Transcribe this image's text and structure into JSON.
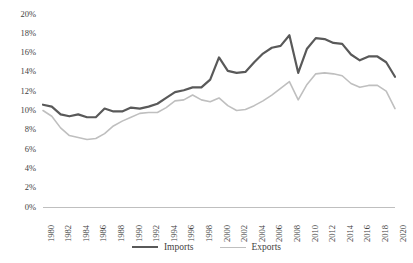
{
  "chart_data": {
    "type": "line",
    "title": "",
    "xlabel": "",
    "ylabel": "",
    "xlim": [
      1980,
      2020
    ],
    "ylim": [
      0,
      20
    ],
    "y_tick_suffix": "%",
    "y_ticks": [
      0,
      2,
      4,
      6,
      8,
      10,
      12,
      14,
      16,
      18,
      20
    ],
    "y_tick_labels": [
      "0%",
      "2%",
      "4%",
      "6%",
      "8%",
      "10%",
      "12%",
      "14%",
      "16%",
      "18%",
      "20%"
    ],
    "x_ticks": [
      1980,
      1982,
      1984,
      1986,
      1988,
      1990,
      1992,
      1994,
      1996,
      1998,
      2000,
      2002,
      2004,
      2006,
      2008,
      2010,
      2012,
      2014,
      2016,
      2018,
      2020
    ],
    "x_tick_labels": [
      "1980",
      "1982",
      "1984",
      "1986",
      "1988",
      "1990",
      "1992",
      "1994",
      "1996",
      "1998",
      "2000",
      "2002",
      "2004",
      "2006",
      "2008",
      "2010",
      "2012",
      "2014",
      "2016",
      "2018",
      "2020"
    ],
    "x": [
      1980,
      1981,
      1982,
      1983,
      1984,
      1985,
      1986,
      1987,
      1988,
      1989,
      1990,
      1991,
      1992,
      1993,
      1994,
      1995,
      1996,
      1997,
      1998,
      1999,
      2000,
      2001,
      2002,
      2003,
      2004,
      2005,
      2006,
      2007,
      2008,
      2009,
      2010,
      2011,
      2012,
      2013,
      2014,
      2015,
      2016,
      2017,
      2018,
      2019,
      2020
    ],
    "grid": false,
    "legend_position": "bottom",
    "series": [
      {
        "name": "Imports",
        "color": "#595959",
        "line_width": 2.2,
        "values": [
          10.6,
          10.4,
          9.6,
          9.4,
          9.6,
          9.3,
          9.3,
          10.2,
          9.9,
          9.9,
          10.3,
          10.2,
          10.4,
          10.7,
          11.3,
          11.9,
          12.1,
          12.4,
          12.4,
          13.2,
          15.5,
          14.1,
          13.9,
          14.0,
          15.0,
          15.9,
          16.5,
          16.7,
          17.8,
          13.9,
          16.4,
          17.5,
          17.4,
          17.0,
          16.9,
          15.8,
          15.2,
          15.6,
          15.6,
          15.0,
          13.5
        ]
      },
      {
        "name": "Exports",
        "color": "#bfbfbf",
        "line_width": 1.6,
        "values": [
          10.0,
          9.4,
          8.2,
          7.4,
          7.2,
          7.0,
          7.1,
          7.6,
          8.4,
          8.9,
          9.3,
          9.7,
          9.8,
          9.8,
          10.3,
          11.0,
          11.1,
          11.6,
          11.1,
          10.9,
          11.3,
          10.5,
          10.0,
          10.1,
          10.5,
          11.0,
          11.6,
          12.3,
          13.0,
          11.1,
          12.7,
          13.8,
          13.9,
          13.8,
          13.6,
          12.8,
          12.4,
          12.6,
          12.6,
          12.0,
          10.2
        ]
      }
    ]
  },
  "legend": {
    "items": [
      {
        "label": "Imports"
      },
      {
        "label": "Exports"
      }
    ]
  }
}
